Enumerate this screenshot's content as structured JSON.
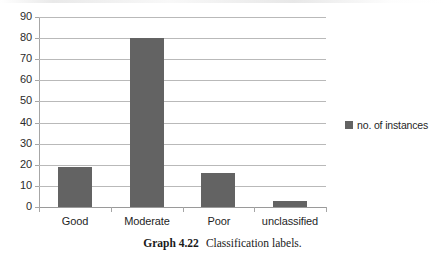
{
  "chart_data": {
    "type": "bar",
    "title": "",
    "subtitle": "",
    "xlabel": "",
    "ylabel": "",
    "categories": [
      "Good",
      "Moderate",
      "Poor",
      "unclassified"
    ],
    "series": [
      {
        "name": "no. of instances",
        "values": [
          19,
          80,
          16,
          3
        ]
      }
    ],
    "values": [
      19,
      80,
      16,
      3
    ],
    "ylim": [
      0,
      90
    ],
    "ytick_values": [
      0,
      10,
      20,
      30,
      40,
      50,
      60,
      70,
      80,
      90
    ],
    "ytick_labels": [
      "0",
      "10",
      "20",
      "30",
      "40",
      "50",
      "60",
      "70",
      "80",
      "90"
    ],
    "grid": true,
    "grid_axis": "y",
    "legend_position": "right",
    "bar_color": "#636363",
    "gridline_color": "#b9b9b9",
    "axis_color": "#a6a6a6"
  },
  "legend": {
    "entries": [
      {
        "label": "no. of instances",
        "color": "#636363",
        "marker": "square-swatch"
      }
    ]
  },
  "caption": {
    "number": "Graph 4.22",
    "text": "Classification labels."
  }
}
